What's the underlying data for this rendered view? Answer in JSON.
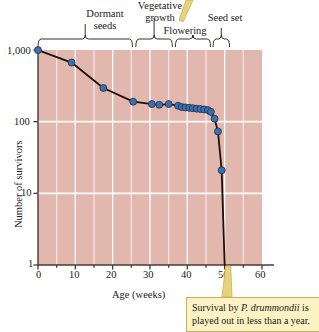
{
  "chart_data": {
    "type": "line",
    "title": "",
    "xlabel": "Age (weeks)",
    "ylabel": "Number of survivors",
    "xlim": [
      0,
      60
    ],
    "ylim": [
      1,
      1000
    ],
    "yscale": "log",
    "grid": true,
    "legend": "none",
    "xticks": [
      "0",
      "10",
      "20",
      "30",
      "40",
      "50",
      "60"
    ],
    "xtick_values": [
      0,
      10,
      20,
      30,
      40,
      50,
      60
    ],
    "yticks": [
      "1",
      "10",
      "100",
      "1,000"
    ],
    "ytick_values": [
      1,
      10,
      100,
      1000
    ],
    "series": [
      {
        "name": "P. drummondii survivors",
        "marker": "circle",
        "marker_color": "#3f6fa8",
        "line_color": "#1c1008",
        "points": [
          {
            "x": 0,
            "y": 996
          },
          {
            "x": 9,
            "y": 668
          },
          {
            "x": 17.5,
            "y": 295
          },
          {
            "x": 25.5,
            "y": 190
          },
          {
            "x": 30.5,
            "y": 176
          },
          {
            "x": 32.5,
            "y": 172
          },
          {
            "x": 35,
            "y": 176
          },
          {
            "x": 37.5,
            "y": 167
          },
          {
            "x": 38.5,
            "y": 160
          },
          {
            "x": 39.5,
            "y": 158
          },
          {
            "x": 40.5,
            "y": 156
          },
          {
            "x": 41.5,
            "y": 154
          },
          {
            "x": 42.5,
            "y": 152
          },
          {
            "x": 43.5,
            "y": 150
          },
          {
            "x": 44.5,
            "y": 148
          },
          {
            "x": 45.5,
            "y": 145
          },
          {
            "x": 46.3,
            "y": 137
          },
          {
            "x": 47.3,
            "y": 110
          },
          {
            "x": 48.2,
            "y": 73
          },
          {
            "x": 49.2,
            "y": 21
          },
          {
            "x": 50,
            "y": 1
          }
        ]
      }
    ],
    "annotations": [
      {
        "type": "bracket",
        "label": "Dormant\nseeds",
        "x_start": 0,
        "x_end": 25.3
      },
      {
        "type": "bracket",
        "label": "Vegetative\ngrowth",
        "x_start": 26.2,
        "x_end": 36.0
      },
      {
        "type": "bracket",
        "label": "Flowering",
        "x_start": 36.8,
        "x_end": 46.2
      },
      {
        "type": "bracket",
        "label": "Seed set",
        "x_start": 46.9,
        "x_end": 51.3
      }
    ],
    "plot_background": "#e2b7ae",
    "gridline_color": "#ffffff"
  },
  "axes": {
    "ylabel": "Number of survivors",
    "xlabel": "Age (weeks)",
    "ytick_labels": [
      "1,000",
      "100",
      "10",
      "1"
    ],
    "xtick_labels": [
      "0",
      "10",
      "20",
      "30",
      "40",
      "50",
      "60"
    ]
  },
  "phases": {
    "dormant_seeds": "Dormant\nseeds",
    "vegetative_growth": "Vegetative\ngrowth",
    "flowering": "Flowering",
    "seed_set": "Seed set"
  },
  "callout": {
    "text_before": "Survival by ",
    "species": "P. drummondii",
    "text_after": " is played out in less than a year."
  },
  "colors": {
    "plot_background": "#e2b7ae",
    "gridline": "#ffffff",
    "marker_fill": "#3f6fa8",
    "marker_stroke": "#17304f",
    "data_line": "#1c1008",
    "callout_fill": "#fdf2c4",
    "callout_border": "#c9ae5a",
    "callout_pointer": "#e8d27a",
    "axis": "#4a3a33"
  }
}
